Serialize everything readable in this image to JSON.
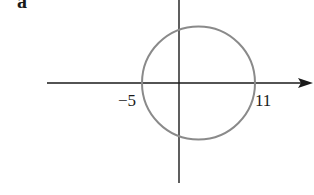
{
  "figure": {
    "part_label": "a",
    "axes": {
      "x_axis": {
        "arrow": "right"
      },
      "y_axis": {
        "arrow": "none"
      }
    },
    "circle": {
      "stroke_color": "#8a8a8a",
      "x_intercepts": [
        -5,
        11
      ]
    },
    "tick_labels": {
      "left": "−5",
      "right": "11"
    },
    "colors": {
      "axis": "#1a1a1a",
      "circle": "#8a8a8a",
      "background": "#ffffff"
    }
  }
}
